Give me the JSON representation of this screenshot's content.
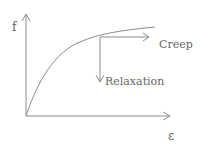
{
  "diagram": {
    "y_axis_label": "f",
    "x_axis_label": "ε",
    "annotations": {
      "creep": "Creep",
      "relaxation": "Relaxation"
    },
    "colors": {
      "line": "#8c8c8c",
      "text": "#666666",
      "background": "#ffffff"
    }
  }
}
